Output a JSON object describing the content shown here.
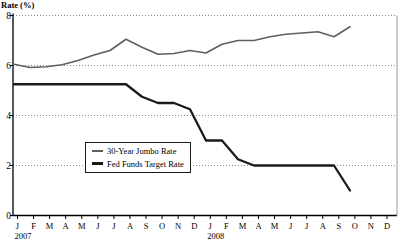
{
  "chart_data": {
    "type": "line",
    "title": "Rate (%)",
    "ylabel": "Rate (%)",
    "xlabel": "",
    "ylim": [
      0,
      8
    ],
    "yticks": [
      0,
      2,
      4,
      6,
      8
    ],
    "grid": "horizontal dotted lines at each y tick",
    "legend_position": "inside plot, center-left, boxed",
    "x_categories": [
      "J",
      "F",
      "M",
      "A",
      "M",
      "J",
      "J",
      "A",
      "S",
      "O",
      "N",
      "D",
      "J",
      "F",
      "M",
      "A",
      "M",
      "J",
      "J",
      "A",
      "S",
      "O",
      "N",
      "D"
    ],
    "year_labels": [
      {
        "label": "2007",
        "month_index": 0
      },
      {
        "label": "2008",
        "month_index": 12
      }
    ],
    "colors": {
      "axis": "#000000",
      "grid": "#8a8a8a",
      "frame_right": "#999999",
      "background": "#ffffff"
    },
    "series": [
      {
        "name": "30-Year Jumbo Rate",
        "color": "#5f5f5f",
        "width": 1.6,
        "values": [
          6.05,
          5.92,
          5.95,
          6.03,
          6.2,
          6.42,
          6.6,
          7.05,
          6.73,
          6.45,
          6.48,
          6.6,
          6.5,
          6.85,
          7.0,
          7.0,
          7.15,
          7.25,
          7.3,
          7.35,
          7.15,
          7.55
        ]
      },
      {
        "name": "Fed Funds Target Rate",
        "color": "#1a1a1a",
        "width": 2.3,
        "values": [
          5.25,
          5.25,
          5.25,
          5.25,
          5.25,
          5.25,
          5.25,
          5.25,
          4.75,
          4.5,
          4.5,
          4.25,
          3.0,
          3.0,
          2.25,
          2.0,
          2.0,
          2.0,
          2.0,
          2.0,
          2.0,
          1.0
        ]
      }
    ]
  }
}
